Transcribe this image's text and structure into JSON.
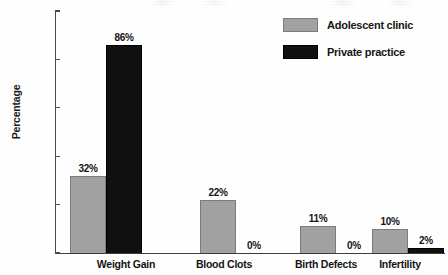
{
  "chart_data": {
    "type": "bar",
    "title": "",
    "xlabel": "",
    "ylabel": "Percentage",
    "ylim": [
      0,
      100
    ],
    "yticks": [
      0,
      20,
      40,
      60,
      80,
      100
    ],
    "ytick_labels": [
      "0",
      "20",
      "40",
      "60",
      "80",
      "100"
    ],
    "grid": false,
    "legend_position": "top-right",
    "categories": [
      "Weight Gain",
      "Blood Clots",
      "Birth Defects",
      "Infertility"
    ],
    "series": [
      {
        "name": "Adolescent clinic",
        "color": "#a2a2a2",
        "values": [
          32,
          22,
          11,
          10
        ],
        "value_labels": [
          "32%",
          "22%",
          "11%",
          "10%"
        ]
      },
      {
        "name": "Private practice",
        "color": "#101010",
        "values": [
          86,
          0,
          0,
          2
        ],
        "value_labels": [
          "86%",
          "0%",
          "0%",
          "2%"
        ]
      }
    ]
  },
  "axis": {
    "y_title": "Percentage"
  },
  "legend": {
    "items": [
      {
        "label": "Adolescent clinic",
        "swatch": "series-a"
      },
      {
        "label": "Private practice",
        "swatch": "series-b"
      }
    ]
  }
}
